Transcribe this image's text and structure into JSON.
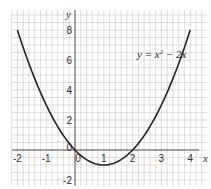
{
  "chart_data": {
    "type": "line",
    "title": "",
    "xlabel": "x",
    "ylabel": "y",
    "xlim": [
      -2.2,
      4.4
    ],
    "ylim": [
      -2.5,
      9.0
    ],
    "grid": true,
    "grid_minor_step_x": 0.2,
    "grid_minor_step_y": 0.5,
    "x_ticks": [
      -2,
      -1,
      0,
      1,
      2,
      3,
      4
    ],
    "x_tick_labels": [
      "-2",
      "-1",
      "0",
      "1",
      "2",
      "3",
      "4"
    ],
    "y_ticks": [
      -2,
      0,
      2,
      4,
      6,
      8
    ],
    "y_tick_labels": [
      "-2",
      "0",
      "2",
      "4",
      "6",
      "8"
    ],
    "series": [
      {
        "name": "y = x² − 2x",
        "function": "x^2 - 2x",
        "x": [
          -2,
          -1.5,
          -1,
          -0.5,
          0,
          0.5,
          1,
          1.5,
          2,
          2.5,
          3,
          3.5,
          4
        ],
        "y": [
          8,
          5.25,
          3,
          1.25,
          0,
          -0.75,
          -1,
          -0.75,
          0,
          1.25,
          3,
          5.25,
          8
        ]
      }
    ],
    "annotations": [
      {
        "text": "y = x² − 2x",
        "x": 2.6,
        "y": 6.2
      }
    ]
  },
  "labels": {
    "x_axis": "x",
    "y_axis": "y",
    "origin": "0",
    "equation_prefix": "y = x",
    "equation_exp": "2",
    "equation_suffix": " − 2x"
  },
  "colors": {
    "grid": "#c8c8c8",
    "axis": "#555555",
    "curve": "#222222",
    "background": "#ffffff"
  }
}
